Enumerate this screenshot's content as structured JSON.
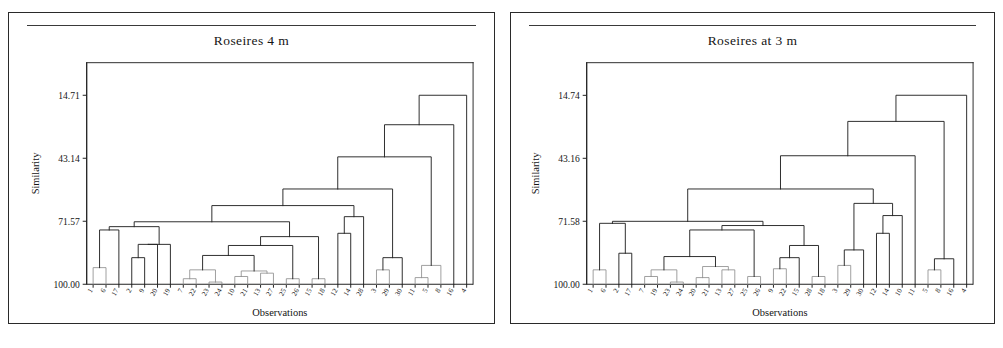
{
  "figure": {
    "background_color": "#ffffff",
    "line_color": "#232323",
    "panel_border_color": "#2a2a2a"
  },
  "panels": [
    {
      "id": "left",
      "title": "Roseires 4 m",
      "axis_title_y": "Similarity",
      "axis_title_x": "Observations"
    },
    {
      "id": "right",
      "title": "Roseires at 3 m",
      "axis_title_y": "Similarity",
      "axis_title_x": "Observations"
    }
  ],
  "chart_data": [
    {
      "type": "line",
      "subtype": "dendrogram",
      "title": "Roseires 4 m",
      "xlabel": "Observations",
      "ylabel": "Similarity",
      "ylim": [
        100.0,
        0.0
      ],
      "y_axis_inverted": true,
      "ytick_labels": [
        "14.71",
        "43.14",
        "71.57",
        "100.00"
      ],
      "ytick_values": [
        14.71,
        43.14,
        71.57,
        100.0
      ],
      "grid": false,
      "legend": "none",
      "n_leaves": 28,
      "leaf_order": [
        "1",
        "6",
        "17",
        "2",
        "9",
        "20",
        "19",
        "7",
        "22",
        "23",
        "24",
        "10",
        "21",
        "13",
        "27",
        "25",
        "26",
        "15",
        "18",
        "12",
        "14",
        "28",
        "3",
        "19",
        "20",
        "11",
        "5",
        "8",
        "16",
        "4"
      ],
      "leaf_labels": [
        "1",
        "6",
        "17",
        "2",
        "9",
        "20",
        "19",
        "7",
        "22",
        "23",
        "24",
        "10",
        "21",
        "13",
        "27",
        "25",
        "26",
        "15",
        "18",
        "12",
        "14",
        "28",
        "3",
        "29",
        "30",
        "11",
        "5",
        "8",
        "16",
        "4"
      ],
      "merges": [
        {
          "left": 0,
          "right": 1,
          "similarity": 92.5
        },
        {
          "left": 101,
          "right": 2,
          "similarity": 75.5
        },
        {
          "left": 3,
          "right": 4,
          "similarity": 88.0
        },
        {
          "left": 103,
          "right": 5,
          "similarity": 82.0
        },
        {
          "left": 104,
          "right": 6,
          "similarity": 82.0
        },
        {
          "left": 102,
          "right": 105,
          "similarity": 74.0
        },
        {
          "left": 7,
          "right": 8,
          "similarity": 97.5
        },
        {
          "left": 9,
          "right": 10,
          "similarity": 99.0
        },
        {
          "left": 107,
          "right": 108,
          "similarity": 93.5
        },
        {
          "left": 11,
          "right": 12,
          "similarity": 96.5
        },
        {
          "left": 13,
          "right": 14,
          "similarity": 95.0
        },
        {
          "left": 110,
          "right": 111,
          "similarity": 94.0
        },
        {
          "left": 109,
          "right": 112,
          "similarity": 87.0
        },
        {
          "left": 15,
          "right": 16,
          "similarity": 97.5
        },
        {
          "left": 113,
          "right": 114,
          "similarity": 82.5
        },
        {
          "left": 17,
          "right": 18,
          "similarity": 97.5
        },
        {
          "left": 115,
          "right": 116,
          "similarity": 78.5
        },
        {
          "left": 106,
          "right": 117,
          "similarity": 71.8
        },
        {
          "left": 19,
          "right": 20,
          "similarity": 77.0
        },
        {
          "left": 119,
          "right": 21,
          "similarity": 69.5
        },
        {
          "left": 118,
          "right": 120,
          "similarity": 64.5
        },
        {
          "left": 22,
          "right": 23,
          "similarity": 93.5
        },
        {
          "left": 122,
          "right": 24,
          "similarity": 88.0
        },
        {
          "left": 121,
          "right": 123,
          "similarity": 57.0
        },
        {
          "left": 25,
          "right": 26,
          "similarity": 97.0
        },
        {
          "left": 125,
          "right": 27,
          "similarity": 91.5
        },
        {
          "left": 124,
          "right": 126,
          "similarity": 42.5
        },
        {
          "left": 127,
          "right": 28,
          "similarity": 28.0
        },
        {
          "left": 128,
          "right": 29,
          "similarity": 14.7
        },
        {
          "left": 129,
          "right": 30,
          "similarity": 3.5
        }
      ]
    },
    {
      "type": "line",
      "subtype": "dendrogram",
      "title": "Roseires at 3 m",
      "xlabel": "Observations",
      "ylabel": "Similarity",
      "ylim": [
        100.0,
        0.0
      ],
      "y_axis_inverted": true,
      "ytick_labels": [
        "14.74",
        "43.16",
        "71.58",
        "100.00"
      ],
      "ytick_values": [
        14.74,
        43.16,
        71.58,
        100.0
      ],
      "grid": false,
      "legend": "none",
      "n_leaves": 28,
      "leaf_labels": [
        "1",
        "6",
        "2",
        "17",
        "7",
        "19",
        "23",
        "24",
        "20",
        "21",
        "13",
        "27",
        "25",
        "26",
        "9",
        "22",
        "15",
        "28",
        "18",
        "3",
        "29",
        "30",
        "12",
        "14",
        "10",
        "11",
        "5",
        "8",
        "16",
        "4"
      ],
      "merges": [
        {
          "left": 0,
          "right": 1,
          "similarity": 93.5
        },
        {
          "left": 2,
          "right": 3,
          "similarity": 86.0
        },
        {
          "left": 101,
          "right": 102,
          "similarity": 72.5
        },
        {
          "left": 4,
          "right": 5,
          "similarity": 96.5
        },
        {
          "left": 6,
          "right": 7,
          "similarity": 99.0
        },
        {
          "left": 104,
          "right": 105,
          "similarity": 93.5
        },
        {
          "left": 8,
          "right": 9,
          "similarity": 97.0
        },
        {
          "left": 10,
          "right": 11,
          "similarity": 93.5
        },
        {
          "left": 107,
          "right": 108,
          "similarity": 92.0
        },
        {
          "left": 106,
          "right": 109,
          "similarity": 87.5
        },
        {
          "left": 12,
          "right": 13,
          "similarity": 96.5
        },
        {
          "left": 110,
          "right": 111,
          "similarity": 75.5
        },
        {
          "left": 14,
          "right": 15,
          "similarity": 93.0
        },
        {
          "left": 113,
          "right": 16,
          "similarity": 88.0
        },
        {
          "left": 17,
          "right": 18,
          "similarity": 96.5
        },
        {
          "left": 114,
          "right": 115,
          "similarity": 82.5
        },
        {
          "left": 112,
          "right": 116,
          "similarity": 73.5
        },
        {
          "left": 103,
          "right": 117,
          "similarity": 71.6
        },
        {
          "left": 19,
          "right": 20,
          "similarity": 91.5
        },
        {
          "left": 119,
          "right": 21,
          "similarity": 84.5
        },
        {
          "left": 22,
          "right": 23,
          "similarity": 77.0
        },
        {
          "left": 121,
          "right": 24,
          "similarity": 69.0
        },
        {
          "left": 120,
          "right": 122,
          "similarity": 63.5
        },
        {
          "left": 118,
          "right": 123,
          "similarity": 57.0
        },
        {
          "left": 124,
          "right": 25,
          "similarity": 42.0
        },
        {
          "left": 26,
          "right": 27,
          "similarity": 93.5
        },
        {
          "left": 126,
          "right": 28,
          "similarity": 88.5
        },
        {
          "left": 125,
          "right": 127,
          "similarity": 26.5
        },
        {
          "left": 128,
          "right": 29,
          "similarity": 14.7
        },
        {
          "left": 129,
          "right": 30,
          "similarity": 3.0
        }
      ]
    }
  ]
}
